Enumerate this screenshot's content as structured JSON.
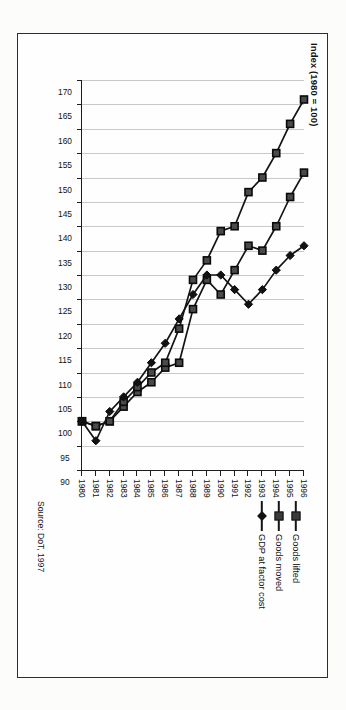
{
  "figure": {
    "axis_title": "Index (1980 = 100)",
    "source_note": "Source: DoT, 1997",
    "frame_color": "#2e2e2e",
    "gridline_color": "#c9c9c9",
    "axis_color": "#1d1d1d"
  },
  "legend": {
    "position": "right",
    "entries": [
      {
        "label": "Goods lifted",
        "marker": "square-marker-icon",
        "color": "#3a3a3a"
      },
      {
        "label": "Goods moved",
        "marker": "square-marker-icon",
        "color": "#3a3a3a"
      },
      {
        "label": "GDP at factor cost",
        "marker": "diamond-marker-icon",
        "color": "#121212"
      }
    ]
  },
  "chart_data": {
    "type": "line",
    "title": "",
    "subtitle": "",
    "xlabel": "",
    "ylabel": "Index (1980 = 100)",
    "ylim": [
      90,
      170
    ],
    "ytick_step": 5,
    "grid": true,
    "legend_position": "right",
    "orientation": "rotated-90-clockwise",
    "annotations": [
      "Source: DoT, 1997"
    ],
    "categories": [
      "1980",
      "1981",
      "1982",
      "1983",
      "1984",
      "1985",
      "1986",
      "1987",
      "1988",
      "1989",
      "1990",
      "1991",
      "1992",
      "1993",
      "1994",
      "1995",
      "1996"
    ],
    "x": [
      1980,
      1981,
      1982,
      1983,
      1984,
      1985,
      1986,
      1987,
      1988,
      1989,
      1990,
      1991,
      1992,
      1993,
      1994,
      1995,
      1996
    ],
    "yticks": [
      90,
      95,
      100,
      105,
      110,
      115,
      120,
      125,
      130,
      135,
      140,
      145,
      150,
      155,
      160,
      165,
      170
    ],
    "series": [
      {
        "name": "Goods lifted",
        "marker": "square",
        "values": [
          100,
          99,
          100,
          103,
          106,
          108,
          111,
          112,
          123,
          129,
          126,
          131,
          136,
          135,
          140,
          146,
          151
        ]
      },
      {
        "name": "Goods moved",
        "values": [
          100,
          99,
          100,
          104,
          107,
          110,
          112,
          119,
          129,
          133,
          139,
          140,
          147,
          150,
          155,
          161,
          166
        ],
        "marker": "square"
      },
      {
        "name": "GDP at factor cost",
        "marker": "diamond",
        "values": [
          100,
          96,
          102,
          105,
          108,
          112,
          116,
          121,
          126,
          130,
          130,
          127,
          124,
          127,
          131,
          134,
          136
        ]
      }
    ]
  }
}
